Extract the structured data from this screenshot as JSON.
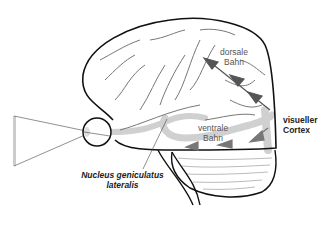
{
  "diagram": {
    "title": "",
    "labels": {
      "dorsal_path": [
        "dorsale",
        "Bahn"
      ],
      "ventral_path": [
        "ventrale",
        "Bahn"
      ],
      "visual_cortex": [
        "visueller",
        "Cortex"
      ],
      "lgn": [
        "Nucleus geniculatus",
        "lateralis"
      ]
    },
    "colors": {
      "outline": "#111111",
      "sulci": "#777777",
      "pathway": "#cccccc",
      "arrow": "#555555"
    }
  }
}
